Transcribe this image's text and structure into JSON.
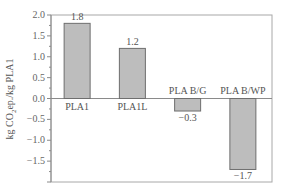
{
  "chart_data": {
    "type": "bar",
    "title": "",
    "xlabel": "",
    "ylabel": "kg CO2ep./kg PLA1",
    "ylabel_parts": {
      "pre": "kg CO",
      "sub": "2",
      "post": "ep./kg PLA1"
    },
    "categories": [
      "PLA1",
      "PLA1L",
      "PLA B/G",
      "PLA B/WP"
    ],
    "values": [
      1.8,
      1.2,
      -0.3,
      -1.7
    ],
    "value_labels": [
      "1.8",
      "1.2",
      "−0.3",
      "−1.7"
    ],
    "ylim": [
      -2.0,
      2.0
    ],
    "yticks": [
      2.0,
      1.5,
      1.0,
      0.5,
      0.0,
      -0.5,
      -1.0,
      -1.5
    ],
    "ytick_labels": [
      "2.0",
      "1.5",
      "1.0",
      "0.5",
      "0.0",
      "−0.5",
      "−1.0",
      "−1.5"
    ],
    "grid": false,
    "legend": null,
    "zero_line": true,
    "colors": {
      "bar_fill": "#bdbdbd",
      "bar_edge": "#6e6e6e",
      "axis": "#8a8a8a",
      "frame": "#a8a8a8"
    }
  }
}
